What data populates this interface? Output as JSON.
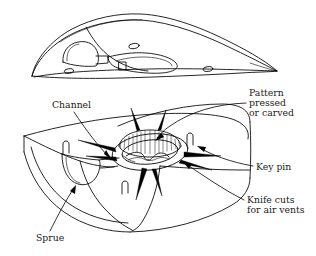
{
  "figure": {
    "style": "black-and-white line drawing",
    "ink_color": "#000000",
    "background_color": "#ffffff",
    "parts": [
      {
        "name": "upper-mold-half",
        "description": "Upper mold half shown from above with cope cavity, vent holes and channel recess"
      },
      {
        "name": "lower-mold-half",
        "description": "Lower mold half shown with pattern impression, central key pin, radiating knife cuts and sprue cup"
      }
    ],
    "annotations": [
      {
        "id": "channel",
        "label": "Channel",
        "lines": [
          "Channel"
        ],
        "anchor": "upper-left",
        "x": 52,
        "y": 108
      },
      {
        "id": "pattern-pressed-or-carved",
        "label": "Pattern pressed or carved",
        "lines": [
          "Pattern",
          "pressed",
          "or carved"
        ],
        "anchor": "upper-right",
        "x": 249,
        "y": 96
      },
      {
        "id": "key-pin",
        "label": "Key pin",
        "lines": [
          "Key pin"
        ],
        "anchor": "middle-right",
        "x": 256,
        "y": 167
      },
      {
        "id": "knife-cuts-for-air-vents",
        "label": "Knife cuts for air vents",
        "lines": [
          "Knife cuts",
          "for air vents"
        ],
        "anchor": "lower-right",
        "x": 247,
        "y": 203
      },
      {
        "id": "sprue",
        "label": "Sprue",
        "lines": [
          "Sprue"
        ],
        "anchor": "lower-left",
        "x": 36,
        "y": 239
      }
    ],
    "pattern_marks": [
      {
        "name": "arch-mark-left",
        "glyph": "n"
      },
      {
        "name": "arch-mark-center",
        "glyph": "n"
      },
      {
        "name": "arch-mark-right",
        "glyph": "n"
      }
    ]
  }
}
